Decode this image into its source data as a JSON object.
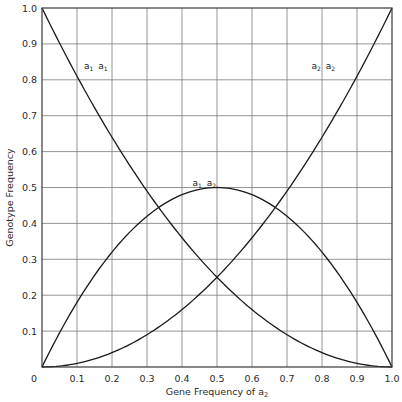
{
  "chart_data": {
    "type": "line",
    "title": "",
    "xlabel": "Gene Frequency of a₂",
    "xlabel_parts": {
      "text": "Gene Frequency of a",
      "sub": "2"
    },
    "ylabel": "Genotype Frequency",
    "xlim": [
      0,
      1.0
    ],
    "ylim": [
      0,
      1.0
    ],
    "grid": true,
    "legend": "none (curves labeled inline)",
    "x_ticks": [
      "0",
      "0.1",
      "0.2",
      "0.3",
      "0.4",
      "0.5",
      "0.6",
      "0.7",
      "0.8",
      "0.9",
      "1.0"
    ],
    "y_ticks": [
      "0.1",
      "0.2",
      "0.3",
      "0.4",
      "0.5",
      "0.6",
      "0.7",
      "0.8",
      "0.9",
      "1.0"
    ],
    "x": [
      0,
      0.1,
      0.2,
      0.3,
      0.4,
      0.5,
      0.6,
      0.7,
      0.8,
      0.9,
      1.0
    ],
    "series": [
      {
        "name": "a1 a1",
        "label": {
          "a": "a",
          "s1": "1",
          "b": "a",
          "s2": "1"
        },
        "formula": "(1-q)^2",
        "values": [
          1.0,
          0.81,
          0.64,
          0.49,
          0.36,
          0.25,
          0.16,
          0.09,
          0.04,
          0.01,
          0.0
        ],
        "label_pos": [
          0.12,
          0.83
        ]
      },
      {
        "name": "a1 a2",
        "label": {
          "a": "a",
          "s1": "1",
          "b": "a",
          "s2": "2"
        },
        "formula": "2q(1-q)",
        "values": [
          0.0,
          0.18,
          0.32,
          0.42,
          0.48,
          0.5,
          0.48,
          0.42,
          0.32,
          0.18,
          0.0
        ],
        "label_pos": [
          0.43,
          0.505
        ]
      },
      {
        "name": "a2 a2",
        "label": {
          "a": "a",
          "s1": "2",
          "b": "a",
          "s2": "2"
        },
        "formula": "q^2",
        "values": [
          0.0,
          0.01,
          0.04,
          0.09,
          0.16,
          0.25,
          0.36,
          0.49,
          0.64,
          0.81,
          1.0
        ],
        "label_pos": [
          0.77,
          0.83
        ]
      }
    ],
    "annotations": [
      "a1 a1",
      "a1 a2",
      "a2 a2"
    ]
  },
  "layout": {
    "plot": {
      "left": 42,
      "top": 8,
      "right": 392,
      "bottom": 367
    },
    "colors": {
      "curve": "#1a1a1a",
      "grid": "#7a7a7a",
      "text": "#2a2a2a"
    }
  }
}
